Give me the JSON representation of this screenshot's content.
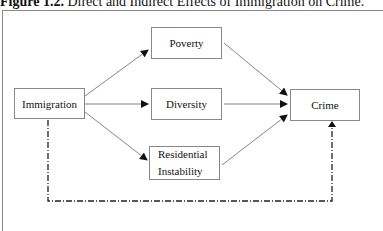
{
  "figure": {
    "label": "Figure 1.2.",
    "caption": "Direct and Indirect Effects of Immigration on Crime."
  },
  "nodes": {
    "immigration": "Immigration",
    "poverty": "Poverty",
    "diversity": "Diversity",
    "residential_line1": "Residential",
    "residential_line2": "Instability",
    "crime": "Crime"
  },
  "edges": [
    {
      "from": "Immigration",
      "to": "Poverty",
      "style": "solid"
    },
    {
      "from": "Immigration",
      "to": "Diversity",
      "style": "solid"
    },
    {
      "from": "Immigration",
      "to": "Residential Instability",
      "style": "solid"
    },
    {
      "from": "Poverty",
      "to": "Crime",
      "style": "solid"
    },
    {
      "from": "Diversity",
      "to": "Crime",
      "style": "solid"
    },
    {
      "from": "Residential Instability",
      "to": "Crime",
      "style": "solid"
    },
    {
      "from": "Immigration",
      "to": "Crime",
      "style": "dash-dot"
    }
  ]
}
